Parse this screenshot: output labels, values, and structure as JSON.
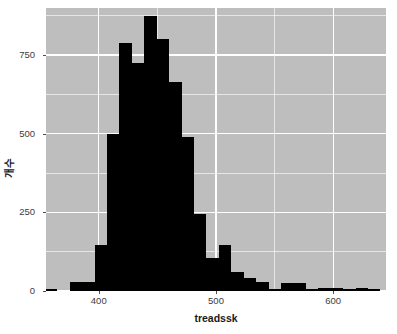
{
  "chart_data": {
    "type": "bar",
    "subtype": "histogram",
    "title": "",
    "xlabel": "treadssk",
    "ylabel": "개수",
    "xlim": [
      355,
      645
    ],
    "ylim": [
      0,
      900
    ],
    "xticks": [
      300,
      400,
      500,
      600
    ],
    "yticks": [
      0,
      250,
      500,
      750
    ],
    "x_minor_ticks": [
      350,
      450,
      550,
      650
    ],
    "y_minor_ticks": [
      125,
      375,
      625,
      875
    ],
    "grid": true,
    "legend": null,
    "bin_width": 10.6,
    "bar_color": "#000000",
    "panel_color": "#bebebe",
    "grid_color": "#ffffff",
    "bins": [
      {
        "x0": 354.0,
        "x1": 364.6,
        "count": 4
      },
      {
        "x0": 364.6,
        "x1": 375.2,
        "count": 0
      },
      {
        "x0": 375.2,
        "x1": 385.8,
        "count": 30
      },
      {
        "x0": 385.8,
        "x1": 396.4,
        "count": 30
      },
      {
        "x0": 396.4,
        "x1": 407.0,
        "count": 145
      },
      {
        "x0": 407.0,
        "x1": 417.6,
        "count": 500
      },
      {
        "x0": 417.6,
        "x1": 428.2,
        "count": 790
      },
      {
        "x0": 428.2,
        "x1": 438.8,
        "count": 725
      },
      {
        "x0": 438.8,
        "x1": 449.4,
        "count": 875
      },
      {
        "x0": 449.4,
        "x1": 460.0,
        "count": 800
      },
      {
        "x0": 460.0,
        "x1": 470.6,
        "count": 665
      },
      {
        "x0": 470.6,
        "x1": 481.2,
        "count": 490
      },
      {
        "x0": 481.2,
        "x1": 491.8,
        "count": 245
      },
      {
        "x0": 491.8,
        "x1": 502.4,
        "count": 105
      },
      {
        "x0": 502.4,
        "x1": 513.0,
        "count": 145
      },
      {
        "x0": 513.0,
        "x1": 523.6,
        "count": 60
      },
      {
        "x0": 523.6,
        "x1": 534.2,
        "count": 42
      },
      {
        "x0": 534.2,
        "x1": 544.8,
        "count": 30
      },
      {
        "x0": 544.8,
        "x1": 555.4,
        "count": 8
      },
      {
        "x0": 555.4,
        "x1": 566.0,
        "count": 25
      },
      {
        "x0": 566.0,
        "x1": 576.6,
        "count": 24
      },
      {
        "x0": 576.6,
        "x1": 587.2,
        "count": 2
      },
      {
        "x0": 587.2,
        "x1": 597.8,
        "count": 10
      },
      {
        "x0": 597.8,
        "x1": 608.4,
        "count": 10
      },
      {
        "x0": 608.4,
        "x1": 619.0,
        "count": 2
      },
      {
        "x0": 619.0,
        "x1": 629.6,
        "count": 9
      },
      {
        "x0": 629.6,
        "x1": 640.2,
        "count": 8
      }
    ]
  }
}
